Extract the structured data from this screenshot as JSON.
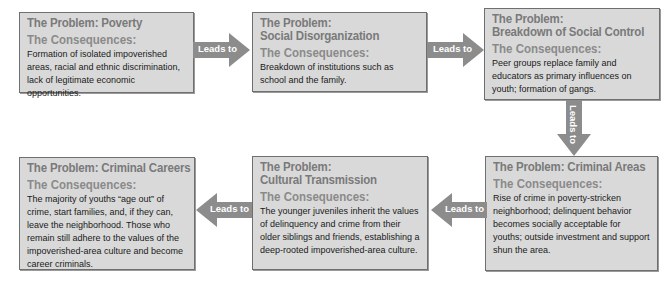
{
  "diagram": {
    "arrow_label": "Leads to",
    "colors": {
      "box_fill": "#d9d9d9",
      "box_border": "#6f6f6f",
      "heading": "#7a7a7a",
      "arrow": "#8c8c8c",
      "arrow_text": "#ffffff",
      "body_text": "#1a1a1a"
    },
    "boxes": [
      {
        "problem_line1": "The Problem: Poverty",
        "problem_line2": "",
        "consequences_label": "The Consequences:",
        "consequences": "Formation of isolated impoverished areas, racial and ethnic discrimination, lack of legitimate economic opportunities."
      },
      {
        "problem_line1": "The Problem:",
        "problem_line2": "Social Disorganization",
        "consequences_label": "The Consequences:",
        "consequences": "Breakdown of institutions such as school and the family."
      },
      {
        "problem_line1": "The Problem:",
        "problem_line2": "Breakdown of Social Control",
        "consequences_label": "The Consequences:",
        "consequences": "Peer groups replace family and educators as primary influences on youth; formation of gangs."
      },
      {
        "problem_line1": "The Problem: Criminal Areas",
        "problem_line2": "",
        "consequences_label": "The Consequences:",
        "consequences": "Rise of crime in poverty-stricken neighborhood; delinquent behavior becomes socially acceptable for youths; outside investment and support shun the area."
      },
      {
        "problem_line1": "The Problem:",
        "problem_line2": "Cultural Transmission",
        "consequences_label": "The Consequences:",
        "consequences": "The younger juveniles inherit the values of delinquency and crime from their older siblings and friends, establishing a deep-rooted impoverished-area culture."
      },
      {
        "problem_line1": "The Problem: Criminal Careers",
        "problem_line2": "",
        "consequences_label": "The Consequences:",
        "consequences": "The majority of youths “age out” of crime, start families, and, if they can, leave the neighborhood.  Those who remain still adhere to the values of the impoverished-area culture and become career criminals."
      }
    ]
  }
}
